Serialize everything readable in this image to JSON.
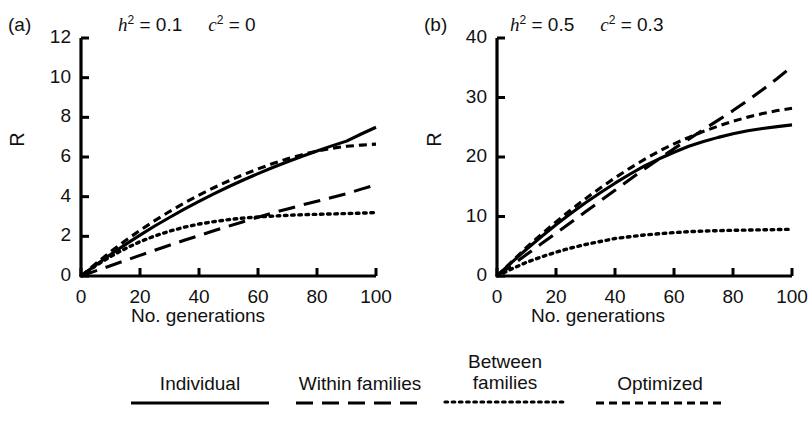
{
  "figure": {
    "panels": [
      {
        "letter": "(a)",
        "title_h": "h",
        "title_h_sup": "2",
        "title_h_val": " = 0.1",
        "title_c": "c",
        "title_c_sup": "2",
        "title_c_val": " = 0",
        "title_plain": "h2 = 0.1   c2 = 0"
      },
      {
        "letter": "(b)",
        "title_h": "h",
        "title_h_sup": "2",
        "title_h_val": " = 0.5",
        "title_c": "c",
        "title_c_sup": "2",
        "title_c_val": " = 0.3",
        "title_plain": "h2 = 0.5   c2 = 0.3"
      }
    ],
    "axis_label_y": "R",
    "axis_label_x": "No. generations"
  },
  "legend": {
    "items": [
      {
        "label": "Individual",
        "style": "solid"
      },
      {
        "label": "Within families",
        "style": "long-dash"
      },
      {
        "label": "Between\nfamilies",
        "style": "dotted"
      },
      {
        "label": "Optimized",
        "style": "short-dash"
      }
    ]
  },
  "chart_data": [
    {
      "type": "line",
      "title": "h2 = 0.1   c2 = 0",
      "panel": "(a)",
      "xlabel": "No. generations",
      "ylabel": "R",
      "xlim": [
        0,
        100
      ],
      "ylim": [
        0,
        12
      ],
      "xticks": [
        0,
        20,
        40,
        60,
        80,
        100
      ],
      "yticks": [
        0,
        2,
        4,
        6,
        8,
        10,
        12
      ],
      "grid": false,
      "legend_position": "below-figure",
      "x": [
        0,
        5,
        10,
        15,
        20,
        25,
        30,
        35,
        40,
        45,
        50,
        55,
        60,
        65,
        70,
        75,
        80,
        85,
        90,
        95,
        100
      ],
      "series": [
        {
          "name": "Individual",
          "style": "solid",
          "values": [
            0,
            0.55,
            1.08,
            1.58,
            2.06,
            2.52,
            2.95,
            3.37,
            3.76,
            4.14,
            4.5,
            4.84,
            5.16,
            5.47,
            5.76,
            6.04,
            6.3,
            6.56,
            6.8,
            7.16,
            7.5
          ]
        },
        {
          "name": "Within families",
          "style": "long-dash",
          "values": [
            0,
            0.26,
            0.52,
            0.78,
            1.04,
            1.3,
            1.55,
            1.8,
            2.04,
            2.28,
            2.51,
            2.74,
            2.96,
            3.18,
            3.38,
            3.58,
            3.77,
            3.96,
            4.15,
            4.38,
            4.6
          ]
        },
        {
          "name": "Between families",
          "style": "dotted",
          "values": [
            0,
            0.52,
            0.98,
            1.38,
            1.73,
            2.02,
            2.26,
            2.46,
            2.62,
            2.74,
            2.84,
            2.92,
            2.98,
            3.02,
            3.06,
            3.09,
            3.11,
            3.13,
            3.15,
            3.17,
            3.2
          ]
        },
        {
          "name": "Optimized",
          "style": "short-dash",
          "values": [
            0,
            0.62,
            1.22,
            1.78,
            2.3,
            2.79,
            3.25,
            3.68,
            4.08,
            4.45,
            4.79,
            5.11,
            5.4,
            5.67,
            5.91,
            6.12,
            6.3,
            6.44,
            6.54,
            6.6,
            6.65
          ]
        }
      ]
    },
    {
      "type": "line",
      "title": "h2 = 0.5   c2 = 0.3",
      "panel": "(b)",
      "xlabel": "No. generations",
      "ylabel": "R",
      "xlim": [
        0,
        100
      ],
      "ylim": [
        0,
        40
      ],
      "xticks": [
        0,
        20,
        40,
        60,
        80,
        100
      ],
      "yticks": [
        0,
        10,
        20,
        30,
        40
      ],
      "grid": false,
      "legend_position": "below-figure",
      "x": [
        0,
        5,
        10,
        15,
        20,
        25,
        30,
        35,
        40,
        45,
        50,
        55,
        60,
        65,
        70,
        75,
        80,
        85,
        90,
        95,
        100
      ],
      "series": [
        {
          "name": "Individual",
          "style": "solid",
          "values": [
            0,
            2.3,
            4.5,
            6.6,
            8.6,
            10.5,
            12.3,
            14.0,
            15.6,
            17.1,
            18.5,
            19.7,
            20.8,
            21.8,
            22.6,
            23.3,
            23.9,
            24.4,
            24.8,
            25.1,
            25.4
          ]
        },
        {
          "name": "Within families",
          "style": "long-dash",
          "values": [
            0,
            1.8,
            3.6,
            5.4,
            7.2,
            9.0,
            10.8,
            12.6,
            14.4,
            16.2,
            18.0,
            19.7,
            21.4,
            23.0,
            24.6,
            26.2,
            27.8,
            29.5,
            31.3,
            33.2,
            35.2
          ]
        },
        {
          "name": "Between families",
          "style": "dotted",
          "values": [
            0,
            1.2,
            2.3,
            3.2,
            4.0,
            4.7,
            5.3,
            5.8,
            6.3,
            6.6,
            6.9,
            7.1,
            7.3,
            7.45,
            7.55,
            7.62,
            7.68,
            7.72,
            7.76,
            7.8,
            7.85
          ]
        },
        {
          "name": "Optimized",
          "style": "short-dash",
          "values": [
            0,
            2.4,
            4.8,
            7.0,
            9.1,
            11.1,
            13.0,
            14.8,
            16.5,
            18.1,
            19.6,
            21.0,
            22.2,
            23.3,
            24.3,
            25.2,
            26.0,
            26.7,
            27.3,
            27.8,
            28.2
          ]
        }
      ]
    }
  ]
}
